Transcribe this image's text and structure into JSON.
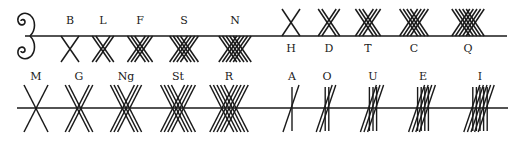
{
  "colors": {
    "ink": "#1a1a1a",
    "background": "#ffffff"
  },
  "ornament": {
    "name": "scroll-ornament",
    "x": 25,
    "y": 36
  },
  "rows": [
    {
      "name": "top-stemline",
      "y": 36,
      "x1": 25,
      "x2": 507,
      "groups": [
        {
          "name": "group-b",
          "side": "below",
          "label_y": 20,
          "letters": [
            {
              "label": "B",
              "cx": 70,
              "count": 1,
              "type": "cross"
            },
            {
              "label": "L",
              "cx": 103,
              "count": 2,
              "type": "cross"
            },
            {
              "label": "F",
              "cx": 140,
              "count": 3,
              "type": "cross"
            },
            {
              "label": "S",
              "cx": 184,
              "count": 4,
              "type": "cross"
            },
            {
              "label": "N",
              "cx": 235,
              "count": 5,
              "type": "cross"
            }
          ]
        },
        {
          "name": "group-h",
          "side": "above",
          "label_y": 48,
          "letters": [
            {
              "label": "H",
              "cx": 291,
              "count": 1,
              "type": "cross"
            },
            {
              "label": "D",
              "cx": 329,
              "count": 2,
              "type": "cross"
            },
            {
              "label": "T",
              "cx": 368,
              "count": 3,
              "type": "cross"
            },
            {
              "label": "C",
              "cx": 414,
              "count": 4,
              "type": "cross"
            },
            {
              "label": "Q",
              "cx": 468,
              "count": 5,
              "type": "cross"
            }
          ]
        }
      ]
    },
    {
      "name": "bottom-stemline",
      "y": 108,
      "x1": 17,
      "x2": 508,
      "groups": [
        {
          "name": "group-m",
          "side": "through",
          "label_y": 76,
          "letters": [
            {
              "label": "M",
              "cx": 36,
              "count": 1,
              "type": "cross"
            },
            {
              "label": "G",
              "cx": 79,
              "count": 2,
              "type": "cross"
            },
            {
              "label": "Ng",
              "cx": 126,
              "count": 3,
              "type": "cross"
            },
            {
              "label": "St",
              "cx": 178,
              "count": 4,
              "type": "cross"
            },
            {
              "label": "R",
              "cx": 229,
              "count": 5,
              "type": "cross"
            }
          ]
        },
        {
          "name": "group-a",
          "side": "through",
          "label_y": 76,
          "letters": [
            {
              "label": "A",
              "cx": 292,
              "count": 1,
              "type": "vowel"
            },
            {
              "label": "O",
              "cx": 327,
              "count": 2,
              "type": "vowel"
            },
            {
              "label": "U",
              "cx": 373,
              "count": 3,
              "type": "vowel"
            },
            {
              "label": "E",
              "cx": 423,
              "count": 4,
              "type": "vowel"
            },
            {
              "label": "I",
              "cx": 480,
              "count": 5,
              "type": "vowel"
            }
          ]
        }
      ]
    }
  ]
}
